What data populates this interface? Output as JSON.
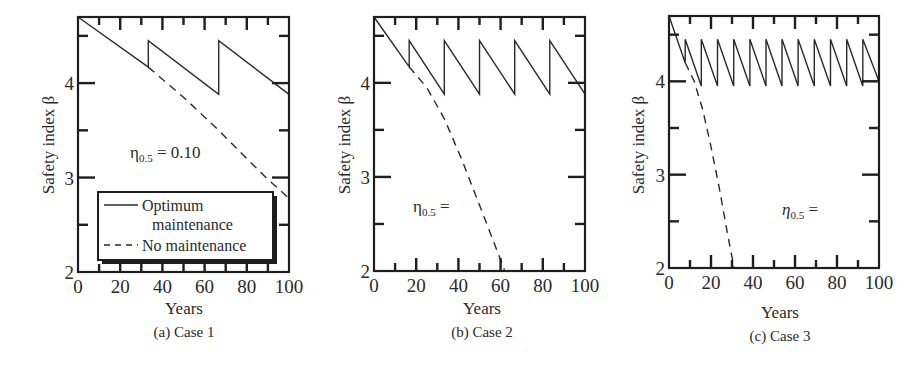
{
  "figure": {
    "panels": [
      {
        "id": "a",
        "caption": "(a) Case 1",
        "xlabel": "Years",
        "ylabel": "Safety index β",
        "annotation": {
          "symbol": "η",
          "subscript": "0.5",
          "text": " = 0.10"
        }
      },
      {
        "id": "b",
        "caption": "(b) Case 2",
        "xlabel": "Years",
        "ylabel": "Safety index β",
        "annotation": {
          "symbol": "η",
          "subscript": "0.5",
          "text": " ="
        }
      },
      {
        "id": "c",
        "caption": "(c) Case 3",
        "xlabel": "Years",
        "ylabel": "Safety index β",
        "annotation": {
          "symbol": "η",
          "subscript": "0.5",
          "text": " ="
        }
      }
    ],
    "legend": {
      "items": [
        {
          "label_line1": "Optimum",
          "label_line2": "maintenance",
          "style": "solid"
        },
        {
          "label_line1": "No maintenance",
          "label_line2": "",
          "style": "dashed"
        }
      ]
    }
  },
  "chart_data": [
    {
      "type": "line",
      "title": "(a) Case 1",
      "xlabel": "Years",
      "ylabel": "Safety index β",
      "xlim": [
        0,
        100
      ],
      "ylim": [
        2,
        4.7
      ],
      "xticks": [
        0,
        20,
        40,
        60,
        80,
        100
      ],
      "yticks": [
        2,
        3,
        4
      ],
      "annotation": "η0.5 = 0.10",
      "legend_position": "lower left (inside)",
      "series": [
        {
          "name": "Optimum maintenance",
          "style": "solid",
          "x": [
            0,
            33.3,
            33.3,
            66.7,
            66.7,
            100
          ],
          "y": [
            4.7,
            4.17,
            4.45,
            3.88,
            4.45,
            3.88
          ]
        },
        {
          "name": "No maintenance",
          "style": "dashed",
          "x": [
            33.3,
            50,
            66.7,
            80,
            90,
            100
          ],
          "y": [
            4.17,
            3.85,
            3.5,
            3.2,
            2.98,
            2.78
          ]
        }
      ]
    },
    {
      "type": "line",
      "title": "(b) Case 2",
      "xlabel": "Years",
      "ylabel": "Safety index β",
      "xlim": [
        0,
        100
      ],
      "ylim": [
        2,
        4.7
      ],
      "xticks": [
        0,
        20,
        40,
        60,
        80,
        100
      ],
      "yticks": [
        2,
        3,
        4
      ],
      "annotation": "η0.5 =",
      "series": [
        {
          "name": "Optimum maintenance",
          "style": "solid",
          "x": [
            0,
            16.7,
            16.7,
            33.3,
            33.3,
            50,
            50,
            66.7,
            66.7,
            83.3,
            83.3,
            100
          ],
          "y": [
            4.7,
            4.17,
            4.45,
            3.88,
            4.45,
            3.88,
            4.45,
            3.88,
            4.45,
            3.88,
            4.45,
            3.88
          ]
        },
        {
          "name": "No maintenance",
          "style": "dashed",
          "x": [
            16.7,
            25,
            33.3,
            41.7,
            50,
            56,
            62
          ],
          "y": [
            4.17,
            3.95,
            3.62,
            3.18,
            2.7,
            2.35,
            2.0
          ]
        }
      ]
    },
    {
      "type": "line",
      "title": "(c) Case 3",
      "xlabel": "Years",
      "ylabel": "Safety index β",
      "xlim": [
        0,
        100
      ],
      "ylim": [
        2,
        4.7
      ],
      "xticks": [
        0,
        20,
        40,
        60,
        80,
        100
      ],
      "yticks": [
        2,
        3,
        4
      ],
      "annotation": "η0.5 =",
      "series": [
        {
          "name": "Optimum maintenance",
          "style": "solid",
          "x": [
            0,
            7.7,
            7.7,
            15.4,
            15.4,
            23.1,
            23.1,
            30.8,
            30.8,
            38.5,
            38.5,
            46.2,
            46.2,
            53.8,
            53.8,
            61.5,
            61.5,
            69.2,
            69.2,
            76.9,
            76.9,
            84.6,
            84.6,
            92.3,
            92.3,
            100,
            92.3
          ],
          "y": [
            4.7,
            4.2,
            4.45,
            3.95,
            4.45,
            3.95,
            4.45,
            3.95,
            4.45,
            3.95,
            4.45,
            3.95,
            4.45,
            3.95,
            4.45,
            3.95,
            4.45,
            3.95,
            4.45,
            3.95,
            4.45,
            3.95,
            4.45,
            3.95,
            4.45,
            4.0,
            4.0
          ]
        },
        {
          "name": "No maintenance",
          "style": "dashed",
          "x": [
            7.7,
            12,
            16,
            20,
            24,
            28,
            31
          ],
          "y": [
            4.2,
            4.0,
            3.7,
            3.3,
            2.85,
            2.35,
            2.0
          ]
        }
      ]
    }
  ]
}
